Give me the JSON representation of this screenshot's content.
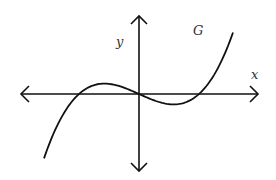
{
  "chart_data": {
    "type": "line",
    "title": "",
    "curve_label": "G",
    "xlabel": "x",
    "ylabel": "y",
    "function": "G(x) = 0.05 * x * (x - 3) * (x + 3)",
    "x_intercepts": [
      -3,
      0,
      3
    ],
    "local_max": {
      "x": -1.73,
      "y": 0.52
    },
    "local_min": {
      "x": 1.73,
      "y": -0.52
    },
    "xlim": [
      -6,
      6
    ],
    "ylim": [
      -4,
      4
    ],
    "domain_drawn": [
      -4.75,
      4.7
    ],
    "grid": false,
    "axes_arrows": true,
    "ticks": false
  },
  "style": {
    "curve_color": "#111111",
    "axis_color": "#111111",
    "label_color": "#333333"
  }
}
